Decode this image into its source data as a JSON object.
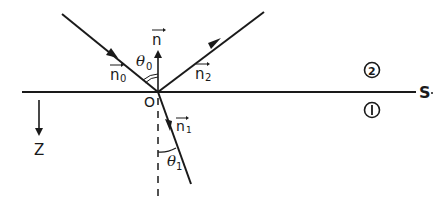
{
  "diagram": {
    "type": "optics-ray-diagram",
    "colors": {
      "ink": "#1a1a1a",
      "background": "#ffffff"
    },
    "labels": {
      "normal_vector": "n",
      "incident_vector": "n",
      "incident_sub": "0",
      "reflected_vector": "n",
      "reflected_sub": "2",
      "refracted_vector": "n",
      "refracted_sub": "1",
      "incident_angle": "θ",
      "incident_angle_sub": "0",
      "refracted_angle": "θ",
      "refracted_angle_sub": "1",
      "origin": "O",
      "surface": "S",
      "medium_upper": "2",
      "medium_lower": "1",
      "z_axis": "Z"
    },
    "elements": [
      {
        "id": "surface",
        "kind": "line",
        "from": [
          22,
          92
        ],
        "to": [
          416,
          92
        ]
      },
      {
        "id": "incident-ray",
        "kind": "ray",
        "from": [
          62,
          14
        ],
        "to": [
          158,
          92
        ]
      },
      {
        "id": "reflected-ray",
        "kind": "ray",
        "from": [
          158,
          92
        ],
        "to": [
          264,
          12
        ]
      },
      {
        "id": "refracted-ray",
        "kind": "ray",
        "from": [
          158,
          92
        ],
        "to": [
          191,
          184
        ]
      },
      {
        "id": "normal",
        "kind": "arrow",
        "from": [
          158,
          92
        ],
        "to": [
          158,
          48
        ]
      },
      {
        "id": "normal-extension",
        "kind": "dashed-line",
        "from": [
          158,
          96
        ],
        "to": [
          158,
          196
        ]
      },
      {
        "id": "z-axis",
        "kind": "arrow",
        "from": [
          39,
          100
        ],
        "to": [
          39,
          138
        ]
      }
    ]
  }
}
